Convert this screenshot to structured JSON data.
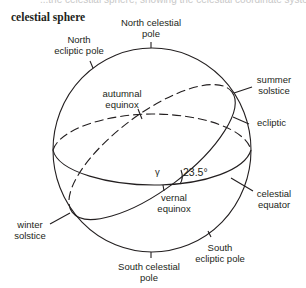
{
  "header": {
    "cut_text": "...the celestial sphere, showing the celestial coordinate systems.",
    "title": "celestial sphere"
  },
  "labels": {
    "north_celestial_pole": [
      "North celestial",
      "pole"
    ],
    "north_ecliptic_pole": [
      "North",
      "ecliptic pole"
    ],
    "summer_solstice": [
      "summer",
      "solstice"
    ],
    "autumnal_equinox": [
      "autumnal",
      "equinox"
    ],
    "ecliptic": "ecliptic",
    "gamma": "γ",
    "angle": "23.5°",
    "vernal_equinox": [
      "vernal",
      "equinox"
    ],
    "celestial_equator": [
      "celestial",
      "equator"
    ],
    "winter_solstice": [
      "winter",
      "solstice"
    ],
    "south_ecliptic_pole": [
      "South",
      "ecliptic pole"
    ],
    "south_celestial_pole": [
      "South celestial",
      "pole"
    ]
  },
  "colors": {
    "line": "#231f20",
    "faint_text": "#c8c8c8"
  }
}
